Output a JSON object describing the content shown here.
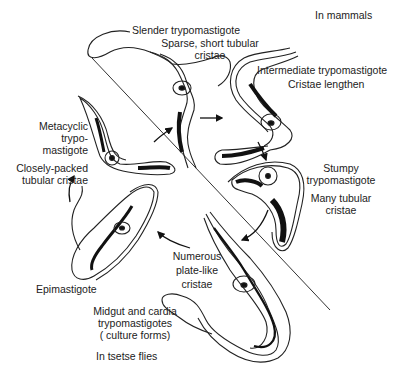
{
  "diagram": {
    "type": "life-cycle",
    "regions": {
      "top_right": "In mammals",
      "bottom_left": "In tsetse flies"
    },
    "stages": [
      {
        "id": "slender",
        "name": "Slender trypomastigote",
        "note": [
          "Sparse, short tubular",
          "cristae"
        ]
      },
      {
        "id": "intermediate",
        "name": "Intermediate trypomastigote",
        "note": [
          "Cristae lengthen"
        ]
      },
      {
        "id": "stumpy",
        "name": [
          "Stumpy",
          "trypomastigote"
        ],
        "note": [
          "Many tubular",
          "cristae"
        ]
      },
      {
        "id": "midgut",
        "name": [
          "Midgut and cardia",
          "trypomastigotes",
          "( culture forms)"
        ],
        "note": [
          "Numerous",
          "plate-like",
          "cristae"
        ]
      },
      {
        "id": "epimastigote",
        "name": "Epimastigote"
      },
      {
        "id": "metacyclic",
        "name": [
          "Metacyclic",
          "trypo-",
          "mastigote"
        ],
        "note": [
          "Closely-packed",
          "tubular cristae"
        ]
      }
    ],
    "cycle_order": [
      "slender",
      "intermediate",
      "stumpy",
      "midgut",
      "epimastigote",
      "metacyclic",
      "slender"
    ],
    "colors": {
      "ink": "#1a1a1a",
      "background": "#ffffff"
    }
  }
}
